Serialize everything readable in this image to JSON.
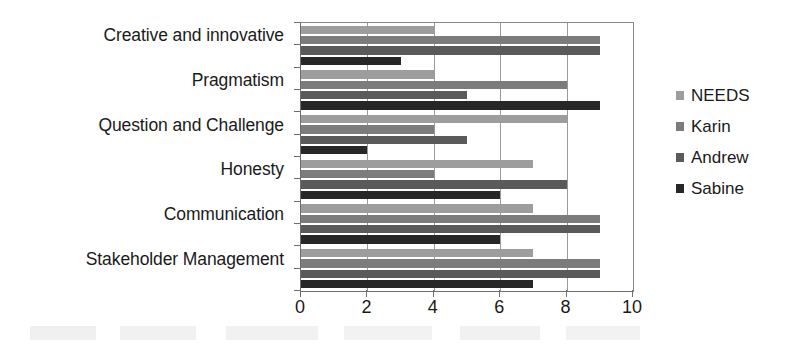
{
  "chart_data": {
    "type": "bar",
    "orientation": "horizontal",
    "title": "",
    "subtitle": "",
    "xlabel": "",
    "ylabel": "",
    "xlim": [
      0,
      10
    ],
    "xticks": [
      "0",
      "2",
      "4",
      "6",
      "8",
      "10"
    ],
    "xtick_values": [
      0,
      2,
      4,
      6,
      8,
      10
    ],
    "grid": true,
    "grid_axis": "x",
    "legend_position": "right",
    "categories": [
      "Creative and innovative",
      "Pragmatism",
      "Question and Challenge",
      "Honesty",
      "Communication",
      "Stakeholder Management"
    ],
    "series": [
      {
        "name": "NEEDS",
        "color": "#9d9d9d",
        "values": [
          4,
          4,
          8,
          7,
          7,
          7
        ]
      },
      {
        "name": "Karin",
        "color": "#7c7c7c",
        "values": [
          9,
          8,
          4,
          4,
          9,
          9
        ]
      },
      {
        "name": "Andrew",
        "color": "#5a5a5a",
        "values": [
          9,
          5,
          5,
          8,
          9,
          9
        ]
      },
      {
        "name": "Sabine",
        "color": "#272727",
        "values": [
          3,
          9,
          2,
          6,
          6,
          7
        ]
      }
    ]
  },
  "legend": {
    "items": [
      {
        "label": "NEEDS",
        "color": "#9d9d9d"
      },
      {
        "label": "Karin",
        "color": "#7c7c7c"
      },
      {
        "label": "Andrew",
        "color": "#5a5a5a"
      },
      {
        "label": "Sabine",
        "color": "#272727"
      }
    ]
  }
}
